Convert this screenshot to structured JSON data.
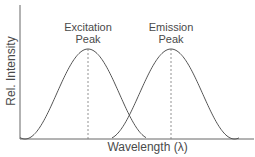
{
  "chart_data": {
    "type": "line",
    "title": "",
    "xlabel": "Wavelength (λ)",
    "ylabel": "Rel. Intensity",
    "grid": false,
    "legend": null,
    "x_ticks": [],
    "y_ticks": [],
    "series": [
      {
        "name": "Excitation",
        "shape": "gaussian",
        "peak_x_px": 88,
        "start_x_px": 20,
        "end_x_px": 146,
        "peak_rel": 1.0
      },
      {
        "name": "Emission",
        "shape": "gaussian",
        "peak_x_px": 171,
        "start_x_px": 112,
        "end_x_px": 239,
        "peak_rel": 1.0
      }
    ],
    "annotations": [
      {
        "text": "Excitation Peak",
        "line1": "Excitation",
        "line2": "Peak",
        "x_px": 88,
        "marker": "dashed vertical line"
      },
      {
        "text": "Emission Peak",
        "line1": "Emission",
        "line2": "Peak",
        "x_px": 171,
        "marker": "dashed vertical line"
      }
    ]
  },
  "labels": {
    "ylabel": "Rel. Intensity",
    "xlabel": "Wavelength (λ)",
    "exc1": "Excitation",
    "exc2": "Peak",
    "em1": "Emission",
    "em2": "Peak"
  }
}
